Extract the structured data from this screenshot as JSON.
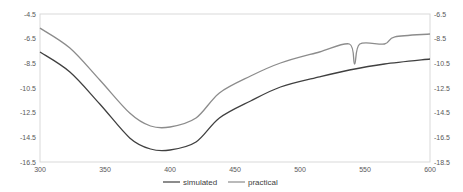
{
  "chart_data": {
    "type": "line",
    "title": "",
    "xlabel": "",
    "ylabel": "",
    "y2label": "",
    "xlim": [
      300,
      600
    ],
    "ylim": [
      -16.5,
      -4.5
    ],
    "y2lim": [
      -18.5,
      -6.5
    ],
    "x_ticks": [
      "300",
      "350",
      "400",
      "450",
      "500",
      "550",
      "600"
    ],
    "y_ticks_left": [
      "-4.5",
      "-6.5",
      "-8.5",
      "-10.5",
      "-12.5",
      "-14.5",
      "-16.5"
    ],
    "y_ticks_right": [
      "-6.5",
      "-8.5",
      "-10.5",
      "-12.5",
      "-14.5",
      "-16.5",
      "-18.5"
    ],
    "grid": false,
    "legend_position": "bottom",
    "series": [
      {
        "name": "simulated",
        "axis": "right",
        "color": "#404040",
        "x": [
          300,
          323,
          346,
          369,
          385,
          400,
          420,
          438,
          462,
          485,
          515,
          538,
          565,
          600
        ],
        "values": [
          -9.58,
          -11.2,
          -13.8,
          -16.55,
          -17.45,
          -17.53,
          -16.88,
          -14.93,
          -13.55,
          -12.42,
          -11.6,
          -11.04,
          -10.55,
          -10.15
        ]
      },
      {
        "name": "practical",
        "axis": "left",
        "color": "#8c8c8c",
        "x": [
          300,
          323,
          346,
          369,
          385,
          400,
          420,
          438,
          462,
          485,
          515,
          538,
          542,
          546,
          565,
          573,
          600
        ],
        "values": [
          -5.64,
          -7.26,
          -9.85,
          -12.53,
          -13.58,
          -13.66,
          -12.93,
          -10.9,
          -9.53,
          -8.47,
          -7.58,
          -6.93,
          -8.55,
          -6.93,
          -6.93,
          -6.36,
          -6.12
        ]
      }
    ]
  },
  "legend": {
    "items": [
      {
        "label": "simulated",
        "color": "#404040"
      },
      {
        "label": "practical",
        "color": "#8c8c8c"
      }
    ]
  }
}
